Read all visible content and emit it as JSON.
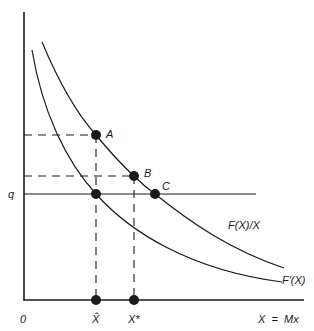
{
  "diagram": {
    "axes": {
      "origin_label": "0",
      "y_label": "q",
      "x_label": "X  =  Mx",
      "tick_labels": [
        "X̂",
        "X*"
      ]
    },
    "curves": [
      {
        "name": "average",
        "label": "F(X)/X"
      },
      {
        "name": "marginal",
        "label": "F'(X)"
      }
    ],
    "points": [
      {
        "name": "A",
        "label": "A"
      },
      {
        "name": "B",
        "label": "B"
      },
      {
        "name": "C",
        "label": "C"
      }
    ],
    "colors": {
      "line": "#1a1a1a",
      "background": "#ffffff"
    }
  }
}
